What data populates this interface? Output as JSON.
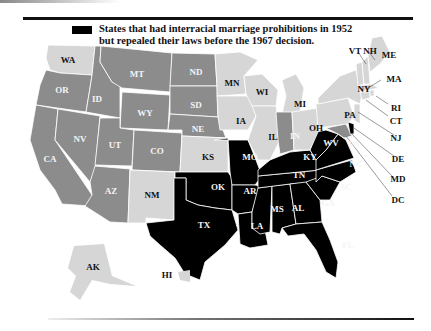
{
  "legend": {
    "swatch_color": "#000000",
    "line1": "States that had interracial marriage prohibitions in 1952",
    "line2": "but repealed their laws before the 1967 decision."
  },
  "colors": {
    "prohibition_until_1967": "#000000",
    "repealed_before_1967": "#8c8c8c",
    "no_prohibition_1952": "#d6d6d6",
    "border": "#ffffff"
  },
  "states": {
    "WA": "WA",
    "OR": "OR",
    "CA": "CA",
    "ID": "ID",
    "NV": "NV",
    "MT": "MT",
    "WY": "WY",
    "UT": "UT",
    "AZ": "AZ",
    "CO": "CO",
    "NM": "NM",
    "ND": "ND",
    "SD": "SD",
    "NE": "NE",
    "KS": "KS",
    "OK": "OK",
    "TX": "TX",
    "MN": "MN",
    "IA": "IA",
    "MO": "MO",
    "AR": "AR",
    "LA": "LA",
    "WI": "WI",
    "IL": "IL",
    "MI": "MI",
    "IN": "IN",
    "OH": "OH",
    "KY": "KY",
    "TN": "TN",
    "MS": "MS",
    "AL": "AL",
    "GA": "GA",
    "FL": "FL",
    "SC": "SC",
    "NC": "NC",
    "VA": "VA",
    "WV": "WV",
    "PA": "PA",
    "NY": "NY",
    "VT": "VT",
    "NH": "NH",
    "ME": "ME",
    "MA": "MA",
    "RI": "RI",
    "CT": "CT",
    "NJ": "NJ",
    "DE": "DE",
    "MD": "MD",
    "DC": "DC",
    "AK": "AK",
    "HI": "HI"
  }
}
